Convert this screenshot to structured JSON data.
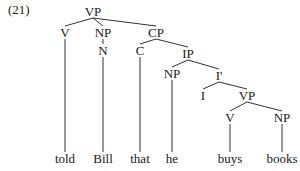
{
  "example_number": "(21)",
  "tree": {
    "nodes": [
      {
        "id": "vp1",
        "label": "VP",
        "x": 93,
        "y": 16
      },
      {
        "id": "v1",
        "label": "V",
        "x": 65,
        "y": 37
      },
      {
        "id": "np1",
        "label": "NP",
        "x": 103,
        "y": 37
      },
      {
        "id": "n1",
        "label": "N",
        "x": 103,
        "y": 55
      },
      {
        "id": "cp",
        "label": "CP",
        "x": 156,
        "y": 37
      },
      {
        "id": "c",
        "label": "C",
        "x": 140,
        "y": 55
      },
      {
        "id": "ip",
        "label": "IP",
        "x": 188,
        "y": 58
      },
      {
        "id": "np2",
        "label": "NP",
        "x": 172,
        "y": 78
      },
      {
        "id": "ibar",
        "label": "I'",
        "x": 219,
        "y": 80
      },
      {
        "id": "i",
        "label": "I",
        "x": 203,
        "y": 100
      },
      {
        "id": "vp2",
        "label": "VP",
        "x": 247,
        "y": 100
      },
      {
        "id": "v2",
        "label": "V",
        "x": 230,
        "y": 122
      },
      {
        "id": "np3",
        "label": "NP",
        "x": 282,
        "y": 122
      },
      {
        "id": "w1",
        "label": "told",
        "x": 65,
        "y": 163
      },
      {
        "id": "w2",
        "label": "Bill",
        "x": 103,
        "y": 163
      },
      {
        "id": "w3",
        "label": "that",
        "x": 140,
        "y": 163
      },
      {
        "id": "w4",
        "label": "he",
        "x": 172,
        "y": 163
      },
      {
        "id": "w5",
        "label": "buys",
        "x": 230,
        "y": 163
      },
      {
        "id": "w6",
        "label": "books",
        "x": 282,
        "y": 163
      }
    ],
    "edges": [
      [
        "vp1",
        "v1"
      ],
      [
        "vp1",
        "np1"
      ],
      [
        "vp1",
        "cp"
      ],
      [
        "np1",
        "n1"
      ],
      [
        "cp",
        "c"
      ],
      [
        "cp",
        "ip"
      ],
      [
        "ip",
        "np2"
      ],
      [
        "ip",
        "ibar"
      ],
      [
        "ibar",
        "i"
      ],
      [
        "ibar",
        "vp2"
      ],
      [
        "vp2",
        "v2"
      ],
      [
        "vp2",
        "np3"
      ],
      [
        "v1",
        "w1"
      ],
      [
        "n1",
        "w2"
      ],
      [
        "c",
        "w3"
      ],
      [
        "np2",
        "w4"
      ],
      [
        "v2",
        "w5"
      ],
      [
        "np3",
        "w6"
      ]
    ]
  }
}
